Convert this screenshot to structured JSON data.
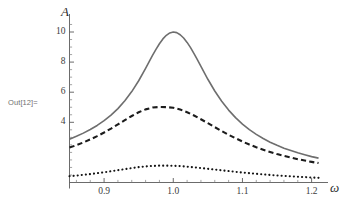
{
  "notebook": {
    "out_prompt": "Out[12]="
  },
  "chart_data": {
    "type": "line",
    "title": "",
    "subtitle": "",
    "xlabel": "ω",
    "ylabel": "A",
    "xlim": [
      0.85,
      1.215
    ],
    "ylim": [
      0.0,
      10.9
    ],
    "grid": false,
    "legend": "none",
    "axis_origin_y_value": 0,
    "xticks": [
      0.9,
      1.0,
      1.1,
      1.2
    ],
    "xtick_labels": [
      "0.9",
      "1.0",
      "1.1",
      "1.2"
    ],
    "xminor_ticks": [
      0.86,
      0.88,
      0.92,
      0.94,
      0.96,
      0.98,
      1.02,
      1.04,
      1.06,
      1.08,
      1.12,
      1.14,
      1.16,
      1.18
    ],
    "yticks": [
      4,
      6,
      8,
      10
    ],
    "ytick_labels": [
      "4",
      "6",
      "8",
      "10"
    ],
    "yminor_ticks": [
      0.5,
      1,
      1.5,
      2,
      2.5,
      3,
      3.5,
      4.5,
      5,
      5.5,
      6.5,
      7,
      7.5,
      8.5,
      9,
      9.5,
      10.5
    ],
    "annotations": [
      {
        "text": "peak at ω = 1.0",
        "visible": false
      }
    ],
    "series": [
      {
        "name": "solid",
        "style": "solid",
        "color": "#6e6e6e",
        "width": 1.6,
        "peak_x": 1.0,
        "peak_y": 10.0,
        "x": [
          0.85,
          0.86,
          0.87,
          0.88,
          0.89,
          0.9,
          0.91,
          0.92,
          0.93,
          0.94,
          0.95,
          0.96,
          0.965,
          0.97,
          0.975,
          0.98,
          0.985,
          0.99,
          0.995,
          1.0,
          1.005,
          1.01,
          1.015,
          1.02,
          1.025,
          1.03,
          1.035,
          1.04,
          1.05,
          1.06,
          1.07,
          1.08,
          1.09,
          1.1,
          1.11,
          1.12,
          1.13,
          1.14,
          1.15,
          1.16,
          1.17,
          1.18,
          1.19,
          1.2,
          1.21
        ],
        "y": [
          2.88,
          3.07,
          3.28,
          3.52,
          3.79,
          4.11,
          4.48,
          4.91,
          5.43,
          6.04,
          6.76,
          7.58,
          8.01,
          8.44,
          8.85,
          9.22,
          9.54,
          9.78,
          9.94,
          10.0,
          9.96,
          9.82,
          9.6,
          9.31,
          8.96,
          8.56,
          8.14,
          7.71,
          6.86,
          6.08,
          5.4,
          4.81,
          4.31,
          3.88,
          3.51,
          3.2,
          2.92,
          2.68,
          2.47,
          2.28,
          2.12,
          1.97,
          1.84,
          1.72,
          1.62
        ]
      },
      {
        "name": "dashed",
        "style": "dashed",
        "color": "#1c1c1c",
        "width": 2.1,
        "peak_x": 0.995,
        "peak_y": 5.02,
        "x": [
          0.85,
          0.86,
          0.87,
          0.88,
          0.89,
          0.9,
          0.91,
          0.92,
          0.93,
          0.94,
          0.95,
          0.96,
          0.97,
          0.98,
          0.99,
          1.0,
          1.01,
          1.02,
          1.03,
          1.04,
          1.05,
          1.06,
          1.07,
          1.08,
          1.09,
          1.1,
          1.11,
          1.12,
          1.13,
          1.14,
          1.15,
          1.16,
          1.17,
          1.18,
          1.19,
          1.2,
          1.21
        ],
        "y": [
          2.32,
          2.48,
          2.66,
          2.86,
          3.08,
          3.32,
          3.58,
          3.86,
          4.14,
          4.42,
          4.67,
          4.86,
          4.98,
          5.02,
          5.01,
          4.97,
          4.85,
          4.67,
          4.45,
          4.2,
          3.94,
          3.68,
          3.42,
          3.17,
          2.94,
          2.72,
          2.52,
          2.34,
          2.18,
          2.03,
          1.89,
          1.77,
          1.66,
          1.55,
          1.46,
          1.37,
          1.29
        ]
      },
      {
        "name": "dotted",
        "style": "dotted",
        "color": "#141414",
        "width": 2.1,
        "peak_x": 0.985,
        "peak_y": 1.12,
        "x": [
          0.85,
          0.86,
          0.87,
          0.88,
          0.89,
          0.9,
          0.91,
          0.92,
          0.93,
          0.94,
          0.95,
          0.96,
          0.97,
          0.98,
          0.99,
          1.0,
          1.01,
          1.02,
          1.03,
          1.04,
          1.05,
          1.06,
          1.07,
          1.08,
          1.09,
          1.1,
          1.11,
          1.12,
          1.13,
          1.14,
          1.15,
          1.16,
          1.17,
          1.18,
          1.19,
          1.2,
          1.21
        ],
        "y": [
          0.42,
          0.46,
          0.51,
          0.56,
          0.62,
          0.68,
          0.75,
          0.82,
          0.89,
          0.96,
          1.02,
          1.07,
          1.1,
          1.12,
          1.12,
          1.11,
          1.09,
          1.05,
          1.01,
          0.96,
          0.91,
          0.86,
          0.81,
          0.76,
          0.71,
          0.66,
          0.62,
          0.58,
          0.54,
          0.5,
          0.47,
          0.44,
          0.41,
          0.38,
          0.36,
          0.33,
          0.31
        ]
      }
    ]
  }
}
